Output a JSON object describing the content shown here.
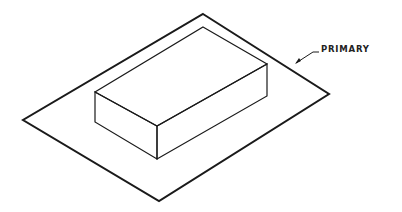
{
  "diagram": {
    "type": "isometric-drawing",
    "labels": {
      "primary": "PRIMARY"
    },
    "colors": {
      "line": "#1a1a1a",
      "background": "#ffffff"
    },
    "shapes": [
      {
        "name": "primary-plate",
        "kind": "parallelogram"
      },
      {
        "name": "rectangular-block",
        "kind": "box"
      }
    ]
  }
}
